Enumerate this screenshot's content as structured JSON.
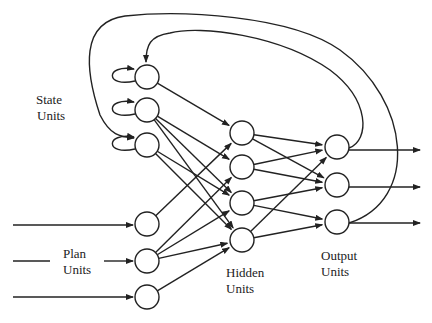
{
  "labels": {
    "state": [
      "State",
      "Units"
    ],
    "plan": [
      "Plan",
      "Units"
    ],
    "hidden": [
      "Hidden",
      "Units"
    ],
    "output": [
      "Output",
      "Units"
    ]
  },
  "layers": {
    "state": [
      {
        "x": 147,
        "y": 77
      },
      {
        "x": 147,
        "y": 110
      },
      {
        "x": 147,
        "y": 145
      }
    ],
    "plan": [
      {
        "x": 147,
        "y": 224
      },
      {
        "x": 147,
        "y": 261
      },
      {
        "x": 147,
        "y": 297
      }
    ],
    "hidden": [
      {
        "x": 242,
        "y": 133
      },
      {
        "x": 242,
        "y": 167
      },
      {
        "x": 242,
        "y": 203
      },
      {
        "x": 242,
        "y": 240
      }
    ],
    "output": [
      {
        "x": 337,
        "y": 147
      },
      {
        "x": 337,
        "y": 185
      },
      {
        "x": 337,
        "y": 222
      }
    ]
  },
  "node_radius": 12,
  "connections": [
    [
      "state",
      0,
      "hidden",
      0
    ],
    [
      "state",
      1,
      "hidden",
      1
    ],
    [
      "state",
      1,
      "hidden",
      2
    ],
    [
      "state",
      1,
      "hidden",
      3
    ],
    [
      "state",
      2,
      "hidden",
      2
    ],
    [
      "state",
      2,
      "hidden",
      3
    ],
    [
      "plan",
      0,
      "hidden",
      0
    ],
    [
      "plan",
      1,
      "hidden",
      1
    ],
    [
      "plan",
      1,
      "hidden",
      2
    ],
    [
      "plan",
      1,
      "hidden",
      3
    ],
    [
      "plan",
      2,
      "hidden",
      3
    ],
    [
      "hidden",
      0,
      "output",
      0
    ],
    [
      "hidden",
      0,
      "output",
      1
    ],
    [
      "hidden",
      1,
      "output",
      0
    ],
    [
      "hidden",
      1,
      "output",
      1
    ],
    [
      "hidden",
      2,
      "output",
      1
    ],
    [
      "hidden",
      2,
      "output",
      2
    ],
    [
      "hidden",
      3,
      "output",
      0
    ],
    [
      "hidden",
      3,
      "output",
      2
    ]
  ],
  "colors": {
    "stroke": "#222222",
    "background": "#ffffff"
  }
}
